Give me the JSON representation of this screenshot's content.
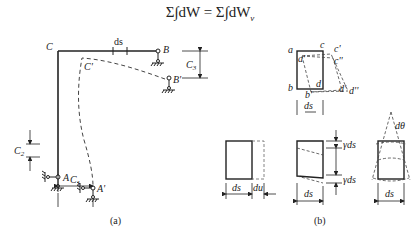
{
  "equation": {
    "lhs": "Σ∫dW",
    "equals": "=",
    "rhs": "Σ∫dW",
    "rhs_subscript": "v"
  },
  "figure_a": {
    "caption": "(a)",
    "labels": {
      "C": "C",
      "C_prime": "C'",
      "B": "B",
      "B_prime": "B'",
      "A": "A",
      "A_prime": "A'",
      "ds": "ds",
      "C1": "C",
      "C1_sub": "1",
      "C2": "C",
      "C2_sub": "2",
      "C3": "C",
      "C3_sub": "3"
    }
  },
  "figure_b": {
    "caption": "(b)",
    "labels": {
      "a": "a",
      "a_prime": "a'",
      "b": "b",
      "b_prime": "b'",
      "c": "c",
      "c_prime": "c'",
      "c_dprime": "c''",
      "d": "d",
      "d_prime": "d'",
      "d_dprime": "d''",
      "ds_top": "ds",
      "ds_axial": "ds",
      "du": "du",
      "ds_shear": "ds",
      "gamma_ds_top": "γds",
      "gamma_ds_bottom": "γds",
      "dtheta": "dθ",
      "ds_bend": "ds"
    }
  }
}
